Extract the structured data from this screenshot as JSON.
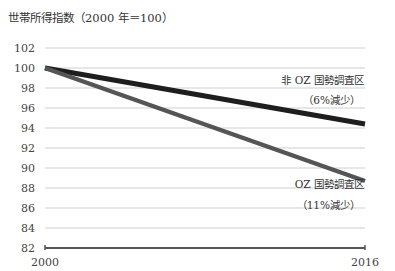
{
  "chart_data": {
    "type": "line",
    "title": "世帯所得指数（2000 年＝100）",
    "xlabel": "",
    "ylabel": "",
    "x": [
      2000,
      2016
    ],
    "x_tick_labels": [
      "2000",
      "2016"
    ],
    "y_ticks": [
      82,
      84,
      86,
      88,
      90,
      92,
      94,
      96,
      98,
      100,
      102
    ],
    "ylim": [
      82,
      102
    ],
    "grid": true,
    "legend_position": "inline-right",
    "series": [
      {
        "name": "非 OZ 国勢調査区",
        "note": "（6%減少）",
        "values": [
          100,
          94.4
        ],
        "color": "#1e1e1e"
      },
      {
        "name": "OZ 国勢調査区",
        "note": "（11%減少）",
        "values": [
          100,
          88.7
        ],
        "color": "#555555"
      }
    ]
  },
  "colors": {
    "grid": "#cfcfcf",
    "axis": "#555555",
    "text": "#333333"
  }
}
